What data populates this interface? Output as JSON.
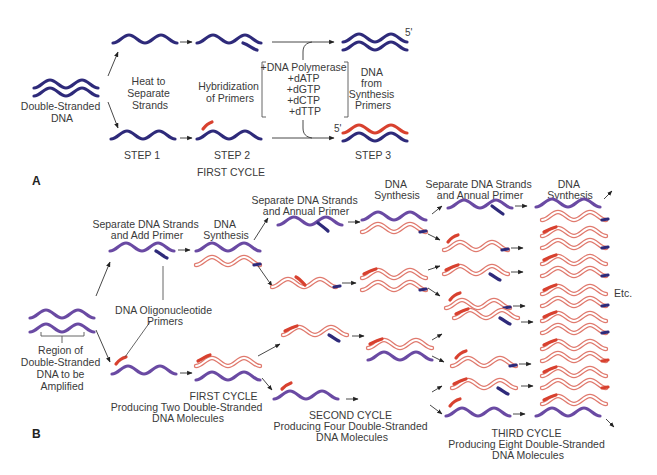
{
  "figure": {
    "panel_a": {
      "label": "A",
      "start_label_1": "Double-Stranded",
      "start_label_2": "DNA",
      "heat_label": [
        "Heat to",
        "Separate",
        "Strands"
      ],
      "hybrid_label": [
        "Hybridization",
        "of Primers"
      ],
      "reagents": [
        "+DNA Polymerase",
        "+dATP",
        "+dGTP",
        "+dCTP",
        "+dTTP"
      ],
      "product_label": [
        "DNA",
        "from",
        "Synthesis",
        "Primers"
      ],
      "five_prime_top": "5'",
      "five_prime_bottom": "5'",
      "steps": [
        "STEP 1",
        "STEP 2",
        "STEP 3"
      ],
      "cycle": "FIRST CYCLE"
    },
    "panel_b": {
      "label": "B",
      "region_label": [
        "Region of",
        "Double-Stranded",
        "DNA to be",
        "Amplified"
      ],
      "step_sep_add": [
        "Separate DNA Strands",
        "and Add Primer"
      ],
      "dna_synthesis_1": [
        "DNA",
        "Synthesis"
      ],
      "oligo_label": [
        "DNA Oligonucleotide",
        "Primers"
      ],
      "step_sep_annual_1": [
        "Separate DNA Strands",
        "and Annual Primer"
      ],
      "dna_synthesis_2": [
        "DNA",
        "Synthesis"
      ],
      "step_sep_annual_2": [
        "Separate DNA Strands",
        "and Annual Primer"
      ],
      "dna_synthesis_3": [
        "DNA",
        "Synthesis"
      ],
      "etc": "Etc.",
      "cycles": [
        {
          "title": "FIRST CYCLE",
          "desc_1": "Producing Two Double-Stranded",
          "desc_2": "DNA Molecules"
        },
        {
          "title": "SECOND CYCLE",
          "desc_1": "Producing Four Double-Stranded",
          "desc_2": "DNA Molecules"
        },
        {
          "title": "THIRD CYCLE",
          "desc_1": "Producing Eight Double-Stranded",
          "desc_2": "DNA Molecules"
        }
      ]
    },
    "colors": {
      "template_dark": "#2e2a7a",
      "template_purple": "#6a4aa3",
      "primer_red": "#d8412f",
      "new_strand_pink": "#e07a6e",
      "text": "#3a3a3a"
    }
  }
}
